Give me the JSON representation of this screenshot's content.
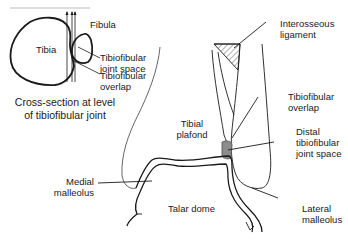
{
  "inset": {
    "tibia": "Tibia",
    "fibula": "Fibula",
    "joint_space": [
      "Tibiofibular",
      "joint space"
    ],
    "overlap": [
      "Tibiofibular",
      "overlap"
    ],
    "caption": [
      "Cross-section at level",
      "of tibiofibular joint"
    ]
  },
  "main": {
    "interosseous_ligament": [
      "Interosseous",
      "ligament"
    ],
    "tibiofibular_overlap": [
      "Tibiofibular",
      "overlap"
    ],
    "distal_joint_space": [
      "Distal",
      "tibiofibular",
      "joint space"
    ],
    "tibial_plafond": [
      "Tibial",
      "plafond"
    ],
    "medial_malleolus": [
      "Medial",
      "malleolus"
    ],
    "lateral_malleolus": [
      "Lateral",
      "malleolus"
    ],
    "talar_dome": "Talar dome"
  },
  "colors": {
    "line": "#1a1a1a",
    "shaded_joint": "#8c8c8c",
    "frame": "#bdbdbd"
  }
}
